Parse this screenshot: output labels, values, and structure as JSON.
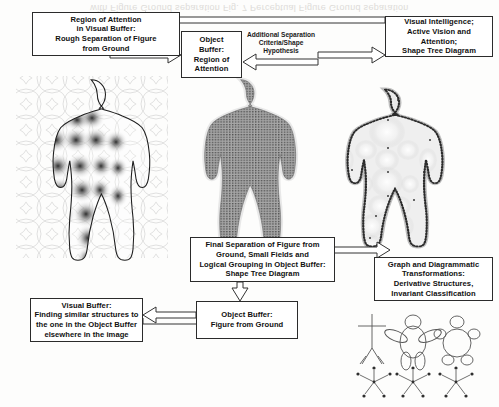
{
  "page": {
    "width": 499,
    "height": 407,
    "background": "#fdfdfc",
    "bleed_through_text": "with Figure Ground separation Fig. 7 Perceptual Figure Ground separation"
  },
  "boxes": [
    {
      "id": "region-of-attention-visual-buffer",
      "lines": [
        "Region of Attention",
        "in Visual Buffer:",
        "Rough Separation of Figure",
        "from Ground"
      ]
    },
    {
      "id": "object-buffer-region-of-attention",
      "lines": [
        "Object",
        "Buffer:",
        "Region of",
        "Attention"
      ]
    },
    {
      "id": "visual-intelligence",
      "lines": [
        "Visual Intelligence;",
        "Active Vision and Attention;",
        "Shape Tree Diagram"
      ]
    },
    {
      "id": "final-separation",
      "lines": [
        "Final Separation of Figure from",
        "Ground, Small Fields and",
        "Logical Grouping in Object Buffer:",
        "Shape Tree Diagram"
      ]
    },
    {
      "id": "graph-and-diagrammatic",
      "lines": [
        "Graph and Diagrammatic",
        "Transformations:",
        "Derivative Structures,",
        "Invariant Classification"
      ]
    },
    {
      "id": "visual-buffer-finding-similar",
      "lines": [
        "Visual Buffer:",
        "Finding similar structures to",
        "the one in the Object Buffer",
        "elsewhere in the image"
      ]
    },
    {
      "id": "object-buffer-figure-from-ground",
      "lines": [
        "Object Buffer:",
        "Figure from Ground"
      ]
    }
  ],
  "edge_labels": [
    {
      "id": "additional-separation-criteria",
      "lines": [
        "Additional Separation",
        "Criteria/Shape",
        "Hypothesis"
      ]
    }
  ],
  "figures": [
    {
      "id": "figure-left-circles-grid",
      "caption": "body outline over overlapping-circle lattice with dark radial blobs"
    },
    {
      "id": "figure-middle-stippled-silhouette",
      "caption": "solid stippled grey human silhouette"
    },
    {
      "id": "figure-right-dotted-outline-blobs",
      "caption": "dotted human outline with pale circular fields inside"
    },
    {
      "id": "stick-figure-thin",
      "caption": "thin line stick figure"
    },
    {
      "id": "stick-figure-oval-limbs",
      "caption": "stick figure with oval torso and limbs"
    },
    {
      "id": "stick-figure-round-body",
      "caption": "stick figure with round body and round limbs"
    },
    {
      "id": "graph-star-1",
      "caption": "star graph with labelled nodes"
    },
    {
      "id": "graph-star-2",
      "caption": "star graph with labelled nodes"
    },
    {
      "id": "graph-star-3",
      "caption": "star graph with labelled nodes"
    }
  ],
  "colors": {
    "ink": "#2b2b2b",
    "paper": "#fdfdfc",
    "figure_grey": "#8f8f8f",
    "arrow_stroke": "#333333"
  }
}
